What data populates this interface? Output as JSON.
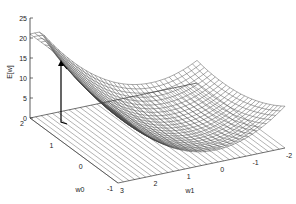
{
  "figure": {
    "title": "",
    "zlabel": "E[w]",
    "xlabel": "w0",
    "ylabel": "w1",
    "z_ticks": [
      "0",
      "5",
      "10",
      "15",
      "20",
      "25"
    ],
    "w0_ticks": [
      "2",
      "1",
      "0",
      "-1"
    ],
    "w1_ticks": [
      "3",
      "2",
      "1",
      "0",
      "-1",
      "-2"
    ],
    "colors": {
      "mesh": "#555555",
      "axis": "#333333",
      "arrow": "#000000",
      "background": "#ffffff"
    }
  },
  "chart_data": {
    "type": "surface",
    "title": "",
    "xlabel": "w0",
    "ylabel": "w1",
    "zlabel": "E[w]",
    "xlim": [
      -1,
      2
    ],
    "ylim": [
      -2,
      3
    ],
    "zlim": [
      0,
      25
    ],
    "corner_values": {
      "w0=2,w1=3": 20,
      "min_region": 0
    },
    "arrow": {
      "from_z": 14,
      "to_z": 0,
      "note": "vertical drop line with arrowhead to surface near w0=2,w1=2.5"
    },
    "grid": true
  }
}
